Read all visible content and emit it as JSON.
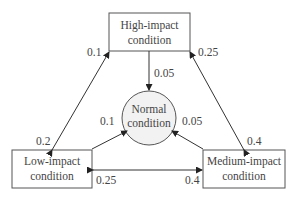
{
  "nodes": {
    "high": {
      "line1": "High-impact",
      "line2": "condition"
    },
    "normal": {
      "line1": "Normal",
      "line2": "condition"
    },
    "low": {
      "line1": "Low-impact",
      "line2": "condition"
    },
    "medium": {
      "line1": "Medium-impact",
      "line2": "condition"
    }
  },
  "edges": {
    "high_to_normal": "0.05",
    "low_to_high": "0.1",
    "high_to_low": "0.2",
    "medium_to_high": "0.25",
    "high_to_medium": "0.4",
    "low_to_normal": "0.1",
    "medium_to_normal": "0.05",
    "medium_to_low": "0.25",
    "low_to_medium": "0.4"
  },
  "colors": {
    "stroke": "#333333",
    "text": "#444444",
    "circle_fill": "#f2f2f2"
  }
}
